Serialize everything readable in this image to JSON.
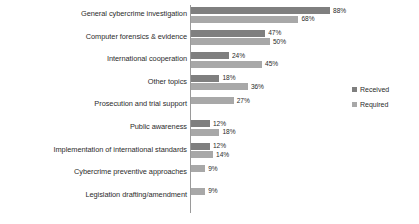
{
  "chart_data": {
    "type": "bar",
    "orientation": "horizontal",
    "title": "",
    "subtitle": "",
    "xlabel": "",
    "ylabel": "",
    "xlim": [
      0,
      95
    ],
    "grid": false,
    "legend_position": "right",
    "value_suffix": "%",
    "categories": [
      "General cybercrime investigation",
      "Computer forensics & evidence",
      "International cooperation",
      "Other topics",
      "Prosecution and trial support",
      "Public awareness",
      "Implementation of international standards",
      "Cybercrime preventive approaches",
      "Legislation drafting/amendment"
    ],
    "series": [
      {
        "name": "Received",
        "color": "#7f7f7f",
        "values": [
          88,
          47,
          24,
          18,
          null,
          12,
          12,
          null,
          null
        ],
        "labels": [
          "88%",
          "47%",
          "24%",
          "18%",
          "",
          "12%",
          "12%",
          "",
          ""
        ]
      },
      {
        "name": "Required",
        "color": "#a8a8a8",
        "values": [
          68,
          50,
          45,
          36,
          27,
          18,
          14,
          9,
          9
        ],
        "labels": [
          "68%",
          "50%",
          "45%",
          "36%",
          "27%",
          "18%",
          "14%",
          "9%",
          "9%"
        ]
      }
    ]
  },
  "legend": {
    "items": [
      {
        "label": "Received",
        "color": "#7f7f7f"
      },
      {
        "label": "Required",
        "color": "#a8a8a8"
      }
    ]
  }
}
